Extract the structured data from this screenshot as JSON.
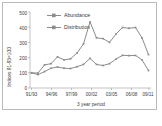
{
  "chart_data": {
    "type": "line",
    "title": "",
    "xlabel": "3 year period",
    "ylabel": "Indices 91-93=100",
    "categories": [
      "91/93",
      "92/94",
      "93/95",
      "94/96",
      "95/97",
      "96/98",
      "97/99",
      "98/00",
      "99/01",
      "00/02",
      "01/03",
      "02/04",
      "03/05",
      "04/06",
      "05/07",
      "06/08",
      "07/09",
      "08/10",
      "09/11"
    ],
    "xtick_labels": [
      "91/93",
      "94/96",
      "97/99",
      "00/02",
      "03/05",
      "06/08",
      "09/11"
    ],
    "ytick_labels": [
      "0",
      "100",
      "200",
      "300",
      "400",
      "500"
    ],
    "ylim": [
      0,
      500
    ],
    "yticks": [
      0,
      100,
      200,
      300,
      400,
      500
    ],
    "grid": false,
    "legend_position": "top-left-inside",
    "series": [
      {
        "name": "Abundance",
        "color": "#8c8c8c",
        "marker": "square",
        "values": [
          100,
          98,
          152,
          160,
          205,
          185,
          192,
          230,
          290,
          435,
          330,
          325,
          300,
          355,
          398,
          393,
          398,
          330,
          220
        ]
      },
      {
        "name": "Distribution",
        "color": "#8c8c8c",
        "marker": "square",
        "values": [
          100,
          88,
          108,
          130,
          138,
          130,
          128,
          140,
          155,
          195,
          155,
          148,
          160,
          190,
          215,
          213,
          214,
          185,
          115
        ]
      }
    ]
  },
  "legend": {
    "items": [
      {
        "label": "Abundance"
      },
      {
        "label": "Distribution"
      }
    ]
  },
  "axes": {
    "y_title": "Indices 91-93=100",
    "x_title": "3 year period",
    "y_ticks": [
      "500",
      "400",
      "300",
      "200",
      "100",
      "0"
    ],
    "x_ticks": [
      "91/93",
      "94/96",
      "97/99",
      "00/02",
      "03/05",
      "06/08",
      "09/11"
    ]
  },
  "colors": {
    "series": "#8c8c8c",
    "axis": "#9a9a9a",
    "text": "#3b3b3b",
    "border": "#b9b9b9",
    "background": "#ffffff"
  }
}
